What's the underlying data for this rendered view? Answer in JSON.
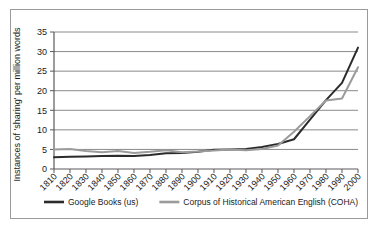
{
  "chart_data": {
    "type": "line",
    "title": "",
    "xlabel": "",
    "ylabel": "Instances of 'sharing' per million words",
    "ylim": [
      0,
      35
    ],
    "ytick_values": [
      0,
      5,
      10,
      15,
      20,
      25,
      30,
      35
    ],
    "ytick_labels": [
      "0",
      "5",
      "10",
      "15",
      "20",
      "25",
      "30",
      "35"
    ],
    "grid": true,
    "grid_axis": "y",
    "legend_position": "bottom",
    "categories": [
      "1810",
      "1820",
      "1830",
      "1840",
      "1850",
      "1860",
      "1870",
      "1880",
      "1890",
      "1900",
      "1910",
      "1920",
      "1930",
      "1940",
      "1950",
      "1960",
      "1970",
      "1980",
      "1990",
      "2000"
    ],
    "series": [
      {
        "name": "Google Books (us)",
        "color": "#2b2b2b",
        "values": [
          3.0,
          3.1,
          3.2,
          3.3,
          3.4,
          3.3,
          3.6,
          4.0,
          4.1,
          4.4,
          4.9,
          5.0,
          5.1,
          5.6,
          6.4,
          7.6,
          12.6,
          17.6,
          22.0,
          31.0
        ]
      },
      {
        "name": "Corpus of Historical American English (COHA)",
        "color": "#9b9b9b",
        "values": [
          5.0,
          5.1,
          4.6,
          4.3,
          4.6,
          4.1,
          4.4,
          4.8,
          4.3,
          4.5,
          4.7,
          5.0,
          4.8,
          5.1,
          6.0,
          9.5,
          13.5,
          17.5,
          18.0,
          26.0
        ]
      }
    ]
  },
  "legend": {
    "items": [
      {
        "label": "Google Books (us)",
        "color": "#2b2b2b"
      },
      {
        "label": "Corpus of Historical American English (COHA)",
        "color": "#9b9b9b"
      }
    ]
  },
  "colors": {
    "series_primary": "#2b2b2b",
    "series_secondary": "#9b9b9b",
    "gridline": "#8a8a8a",
    "axis": "#5a5a5a",
    "border": "#9a9a9a",
    "text": "#1a1a1a"
  }
}
